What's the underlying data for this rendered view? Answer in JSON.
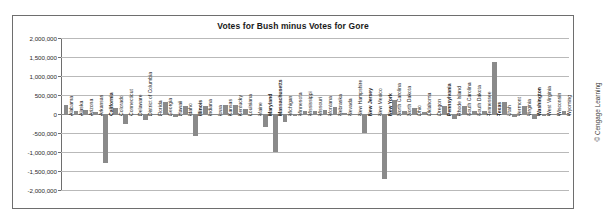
{
  "chart_data": {
    "type": "bar",
    "title": "Votes for Bush minus Votes for Gore",
    "xlabel": "",
    "ylabel": "",
    "ylim": [
      -2000000,
      2000000
    ],
    "ytick_labels": [
      "2,000,000",
      "1,500,000",
      "1,000,000",
      "500,000",
      "0",
      "-500,000",
      "-1,000,000",
      "-1,500,000",
      "-2,000,000"
    ],
    "ytick_values": [
      2000000,
      1500000,
      1000000,
      500000,
      0,
      -500000,
      -1000000,
      -1500000,
      -2000000
    ],
    "grid": true,
    "legend": "none",
    "bar_color": "#8a8a8a",
    "categories": [
      "Alabama",
      "Alaska",
      "Arizona",
      "Arkansas",
      "California",
      "Colorado",
      "Connecticut",
      "Delaware",
      "District of Columbia",
      "Florida",
      "Georgia",
      "Hawaii",
      "Idaho",
      "Illinois",
      "Indiana",
      "Iowa",
      "Kansas",
      "Kentucky",
      "Louisiana",
      "Maine",
      "Maryland",
      "Massachusetts",
      "Michigan",
      "Minnesota",
      "Mississippi",
      "Missouri",
      "Montana",
      "Nebraska",
      "Nevada",
      "New Hampshire",
      "New Jersey",
      "New Mexico",
      "New York",
      "North Carolina",
      "North Dakota",
      "Ohio",
      "Oklahoma",
      "Oregon",
      "Pennsylvania",
      "Rhode Island",
      "South Carolina",
      "South Dakota",
      "Tennessee",
      "Texas",
      "Utah",
      "Vermont",
      "Virginia",
      "Washington",
      "West Virginia",
      "Wisconsin",
      "Wyoming"
    ],
    "values": [
      248000,
      88000,
      96000,
      51000,
      -1293000,
      146000,
      -256000,
      -16000,
      -157000,
      537,
      304000,
      -68000,
      198000,
      -569000,
      221000,
      -4000,
      235000,
      234000,
      135000,
      -33000,
      -330000,
      -1011000,
      -217000,
      -59000,
      68000,
      79000,
      103000,
      190000,
      22000,
      7000,
      -505000,
      -366,
      -1704000,
      373000,
      79000,
      166000,
      64000,
      -7000,
      204000,
      -119000,
      220000,
      72000,
      80000,
      1365000,
      312000,
      -69000,
      220000,
      -138000,
      -41000,
      -6000,
      78000
    ],
    "bold_labels": [
      "California",
      "Illinois",
      "Maryland",
      "Massachusetts",
      "New Jersey",
      "New York",
      "Pennsylvania",
      "Texas",
      "Washington"
    ],
    "copyright": "© Cengage Learning"
  }
}
